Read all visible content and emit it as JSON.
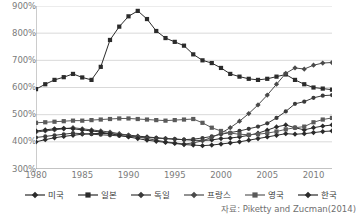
{
  "chart_data": {
    "type": "line",
    "title": "",
    "xlabel": "",
    "ylabel": "",
    "xlim": [
      1980,
      2012
    ],
    "ylim": [
      300,
      900
    ],
    "y_tick_format": "percent",
    "grid": true,
    "legend_position": "bottom",
    "source_note": "자료: Piketty and Zucman(2014)",
    "yticks": [
      {
        "value": 900,
        "label": "900%"
      },
      {
        "value": 800,
        "label": "800%"
      },
      {
        "value": 700,
        "label": "700%"
      },
      {
        "value": 600,
        "label": "600%"
      },
      {
        "value": 500,
        "label": "500%"
      },
      {
        "value": 400,
        "label": "400%"
      },
      {
        "value": 300,
        "label": "300%"
      }
    ],
    "xticks": [
      {
        "value": 1980,
        "label": "1980"
      },
      {
        "value": 1985,
        "label": "1985"
      },
      {
        "value": 1990,
        "label": "1990"
      },
      {
        "value": 1995,
        "label": "1995"
      },
      {
        "value": 2000,
        "label": "2000"
      },
      {
        "value": 2005,
        "label": "2005"
      },
      {
        "value": 2010,
        "label": "2010"
      }
    ],
    "minor_tick_interval": 1,
    "x": [
      1980,
      1981,
      1982,
      1983,
      1984,
      1985,
      1986,
      1987,
      1988,
      1989,
      1990,
      1991,
      1992,
      1993,
      1994,
      1995,
      1996,
      1997,
      1998,
      1999,
      2000,
      2001,
      2002,
      2003,
      2004,
      2005,
      2006,
      2007,
      2008,
      2009,
      2010,
      2011,
      2012
    ],
    "series": [
      {
        "name": "미국",
        "marker": "diamond",
        "color": "#2b2b2b",
        "values": [
          400,
          408,
          415,
          420,
          424,
          428,
          430,
          431,
          430,
          428,
          425,
          421,
          418,
          415,
          412,
          410,
          408,
          406,
          405,
          407,
          412,
          414,
          418,
          424,
          432,
          443,
          455,
          462,
          452,
          444,
          452,
          458,
          462
        ]
      },
      {
        "name": "일본",
        "marker": "square",
        "color": "#2b2b2b",
        "values": [
          594,
          612,
          628,
          638,
          650,
          637,
          628,
          676,
          775,
          824,
          862,
          882,
          852,
          808,
          782,
          768,
          754,
          722,
          700,
          690,
          672,
          650,
          640,
          632,
          628,
          632,
          640,
          648,
          628,
          612,
          600,
          596,
          592
        ]
      },
      {
        "name": "독일",
        "marker": "circle",
        "color": "#3a3a3a",
        "values": [
          416,
          420,
          424,
          428,
          432,
          430,
          428,
          426,
          424,
          422,
          420,
          418,
          416,
          414,
          412,
          410,
          408,
          410,
          414,
          420,
          428,
          434,
          440,
          448,
          456,
          468,
          488,
          512,
          540,
          548,
          562,
          570,
          572
        ]
      },
      {
        "name": "프랑스",
        "marker": "diamond",
        "color": "#4a4a4a",
        "values": [
          436,
          440,
          444,
          448,
          452,
          448,
          444,
          440,
          436,
          430,
          424,
          418,
          412,
          406,
          400,
          396,
          392,
          396,
          404,
          416,
          432,
          452,
          476,
          504,
          536,
          572,
          612,
          652,
          672,
          668,
          682,
          690,
          692
        ]
      },
      {
        "name": "영국",
        "marker": "square",
        "color": "#5a5a5a",
        "values": [
          470,
          472,
          474,
          476,
          478,
          478,
          480,
          482,
          484,
          486,
          486,
          484,
          482,
          480,
          478,
          480,
          482,
          484,
          470,
          452,
          440,
          432,
          428,
          426,
          428,
          432,
          438,
          446,
          452,
          456,
          472,
          482,
          488
        ]
      },
      {
        "name": "한국",
        "marker": "diamond",
        "color": "#2b2b2b",
        "values": [
          440,
          444,
          448,
          450,
          448,
          444,
          440,
          436,
          430,
          424,
          418,
          412,
          406,
          402,
          398,
          394,
          390,
          388,
          386,
          388,
          392,
          396,
          400,
          406,
          412,
          418,
          424,
          430,
          428,
          430,
          434,
          438,
          440
        ]
      }
    ]
  },
  "legend": {
    "items": [
      {
        "label": "미국",
        "marker": "diamond"
      },
      {
        "label": "일본",
        "marker": "square"
      },
      {
        "label": "독일",
        "marker": "diamond"
      },
      {
        "label": "프랑스",
        "marker": "diamond"
      },
      {
        "label": "영국",
        "marker": "square"
      },
      {
        "label": "한국",
        "marker": "diamond"
      }
    ]
  },
  "colors": {
    "grid": "#d9d9d9",
    "axis": "#9a9a9a",
    "tick_text": "#7b7b7b",
    "series_dark": "#2b2b2b",
    "series_mid": "#4a4a4a",
    "series_light": "#6a6a6a"
  }
}
